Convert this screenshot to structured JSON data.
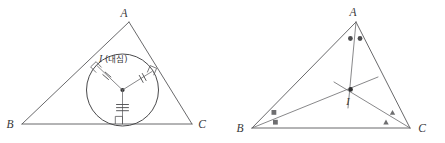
{
  "figure": {
    "background_color": "#ffffff",
    "stroke_color": "#58585a",
    "label_color": "#37373a",
    "left_diagram": {
      "name": "incircle-diagram",
      "description": "Triangle ABC with inscribed circle centred at the incenter I",
      "vertices": {
        "a_label": "A",
        "b_label": "B",
        "c_label": "C"
      },
      "center_label": "I",
      "center_annotation": "(내심)",
      "center_label_full": "I(내심)",
      "radius_marks": {
        "left_radius_ticks": "2",
        "right_radius_ticks": "2",
        "bottom_radius_ticks": "3"
      },
      "right_angle_count": "3"
    },
    "right_diagram": {
      "name": "angle-bisector-diagram",
      "description": "Triangle ABC with the three angle bisectors concurrent at I",
      "vertices": {
        "a_label": "A",
        "b_label": "B",
        "c_label": "C"
      },
      "center_label": "I",
      "angle_marks": {
        "a_mark": "dot",
        "a_mark_count": "2",
        "b_mark": "square",
        "b_mark_count": "2",
        "c_mark": "triangle",
        "c_mark_count": "2"
      }
    }
  }
}
